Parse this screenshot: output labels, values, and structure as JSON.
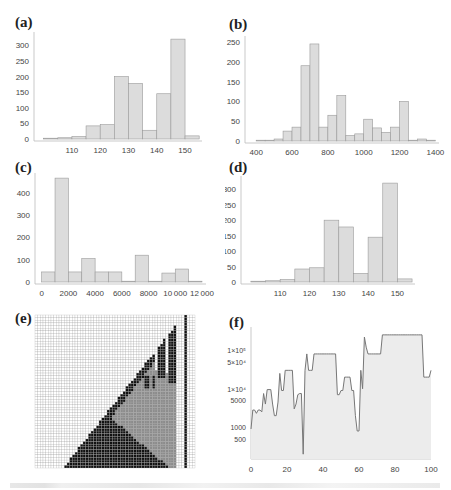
{
  "panels": {
    "a": {
      "label": "(a)"
    },
    "b": {
      "label": "(b)"
    },
    "c": {
      "label": "(c)"
    },
    "d": {
      "label": "(d)"
    },
    "e": {
      "label": "(e)"
    },
    "f": {
      "label": "(f)"
    }
  },
  "colors": {
    "bar_fill": "#dcdcdc",
    "bar_edge": "#9a9a9a",
    "axis": "#bbbbbb",
    "tick_text": "#444444",
    "grid_white": "#ffffff",
    "grid_line": "#a8a8a8",
    "grid_black": "#111111",
    "grid_gray": "#8c8c8c",
    "line": "#777777",
    "area_fill": "#ececec"
  },
  "chart_data": [
    {
      "id": "a",
      "type": "bar",
      "title": "(a)",
      "xlabel": "",
      "ylabel": "",
      "bin_edges": [
        100,
        105,
        110,
        115,
        120,
        125,
        130,
        135,
        140,
        145,
        150,
        155
      ],
      "values": [
        2,
        4,
        8,
        42,
        46,
        200,
        178,
        28,
        145,
        320,
        10
      ],
      "xticks": [
        110,
        120,
        130,
        140,
        150
      ],
      "yticks": [
        0,
        50,
        100,
        150,
        200,
        250,
        300
      ],
      "xlim": [
        98,
        156
      ],
      "ylim": [
        0,
        330
      ],
      "grid": false
    },
    {
      "id": "b",
      "type": "bar",
      "title": "(b)",
      "xlabel": "",
      "ylabel": "",
      "bin_edges": [
        400,
        450,
        500,
        550,
        600,
        650,
        700,
        750,
        800,
        850,
        900,
        950,
        1000,
        1050,
        1100,
        1150,
        1200,
        1250,
        1300,
        1350,
        1400
      ],
      "values": [
        1,
        2,
        5,
        25,
        35,
        190,
        245,
        35,
        65,
        115,
        14,
        18,
        55,
        33,
        22,
        35,
        100,
        2,
        5,
        0
      ],
      "xticks": [
        400,
        600,
        800,
        1000,
        1200,
        1400
      ],
      "yticks": [
        0,
        50,
        100,
        150,
        200,
        250
      ],
      "xlim": [
        360,
        1420
      ],
      "ylim": [
        0,
        255
      ],
      "grid": false
    },
    {
      "id": "c",
      "type": "bar",
      "title": "(c)",
      "xlabel": "",
      "ylabel": "",
      "bin_edges": [
        0,
        1000,
        2000,
        3000,
        4000,
        5000,
        6000,
        7000,
        8000,
        9000,
        10000,
        11000,
        12000
      ],
      "values": [
        45,
        465,
        45,
        105,
        45,
        45,
        0,
        120,
        3,
        40,
        58,
        3
      ],
      "xticks": [
        0,
        2000,
        4000,
        6000,
        8000,
        10000,
        12000
      ],
      "xtick_labels": [
        "0",
        "2000",
        "4000",
        "6000",
        "8000",
        "10 000",
        "12 000"
      ],
      "yticks": [
        0,
        100,
        200,
        300,
        400
      ],
      "xlim": [
        -200,
        12300
      ],
      "ylim": [
        0,
        470
      ],
      "grid": false
    },
    {
      "id": "d",
      "type": "bar",
      "title": "(d)",
      "xlabel": "",
      "ylabel": "",
      "bin_edges": [
        100,
        105,
        110,
        115,
        120,
        125,
        130,
        135,
        140,
        145,
        150,
        155
      ],
      "values": [
        2,
        4,
        8,
        42,
        46,
        200,
        178,
        28,
        145,
        320,
        10
      ],
      "xticks": [
        110,
        120,
        130,
        140,
        150
      ],
      "yticks": [
        0,
        50,
        100,
        150,
        200,
        250,
        300
      ],
      "xlim": [
        98,
        156
      ],
      "ylim": [
        0,
        330
      ],
      "grid": false
    },
    {
      "id": "e",
      "type": "heatmap",
      "title": "(e)",
      "description": "Cellular automaton space-time grid, 3 states (white, gray, black)",
      "cols": 60,
      "rows": 58,
      "states": [
        "white",
        "gray",
        "black"
      ]
    },
    {
      "id": "f",
      "type": "line",
      "title": "(f)",
      "xlabel": "",
      "ylabel": "",
      "yscale": "log",
      "x": [
        0,
        1,
        2,
        3,
        4,
        5,
        6,
        7,
        8,
        9,
        10,
        11,
        12,
        13,
        14,
        15,
        16,
        17,
        18,
        19,
        20,
        21,
        22,
        23,
        24,
        25,
        26,
        27,
        28,
        29,
        30,
        31,
        32,
        33,
        34,
        35,
        36,
        37,
        38,
        39,
        40,
        41,
        42,
        43,
        44,
        45,
        46,
        47,
        48,
        49,
        50,
        51,
        52,
        53,
        54,
        55,
        56,
        57,
        58,
        59,
        60,
        61,
        62,
        63,
        64,
        65,
        66,
        67,
        68,
        69,
        70,
        71,
        72,
        73,
        74,
        75,
        76,
        77,
        78,
        79,
        80,
        81,
        82,
        83,
        84,
        85,
        86,
        87,
        88,
        89,
        90,
        91,
        92,
        93,
        94,
        95,
        96,
        97,
        98,
        99,
        100
      ],
      "y": [
        900,
        2800,
        2800,
        2300,
        2800,
        2800,
        2500,
        7500,
        4000,
        9500,
        9500,
        9500,
        4000,
        2000,
        2000,
        4500,
        25000,
        9000,
        9000,
        30000,
        30000,
        30000,
        30000,
        30000,
        3000,
        4000,
        7000,
        7500,
        7500,
        200,
        30000,
        80000,
        30000,
        30000,
        30000,
        80000,
        80000,
        80000,
        80000,
        80000,
        80000,
        80000,
        80000,
        80000,
        80000,
        80000,
        80000,
        80000,
        7000,
        7000,
        9000,
        9000,
        20000,
        20000,
        20000,
        20000,
        9000,
        9000,
        2000,
        800,
        800,
        30000,
        10000,
        220000,
        120000,
        80000,
        80000,
        80000,
        80000,
        80000,
        80000,
        80000,
        80000,
        250000,
        250000,
        250000,
        250000,
        250000,
        250000,
        250000,
        250000,
        250000,
        250000,
        250000,
        250000,
        250000,
        250000,
        250000,
        250000,
        250000,
        250000,
        250000,
        250000,
        250000,
        250000,
        250000,
        20000,
        20000,
        20000,
        20000,
        30000
      ],
      "xticks": [
        0,
        20,
        40,
        60,
        80,
        100
      ],
      "yticks": [
        500,
        1000,
        5000,
        10000,
        50000,
        100000
      ],
      "ytick_labels": [
        "500",
        "1000",
        "5000",
        "1×10⁴",
        "5×10⁴",
        "1×10⁵"
      ],
      "xlim": [
        0,
        100
      ],
      "ylim": [
        150,
        400000
      ],
      "grid": false,
      "filled": true
    }
  ],
  "caption": {
    "visible": "truncated"
  }
}
